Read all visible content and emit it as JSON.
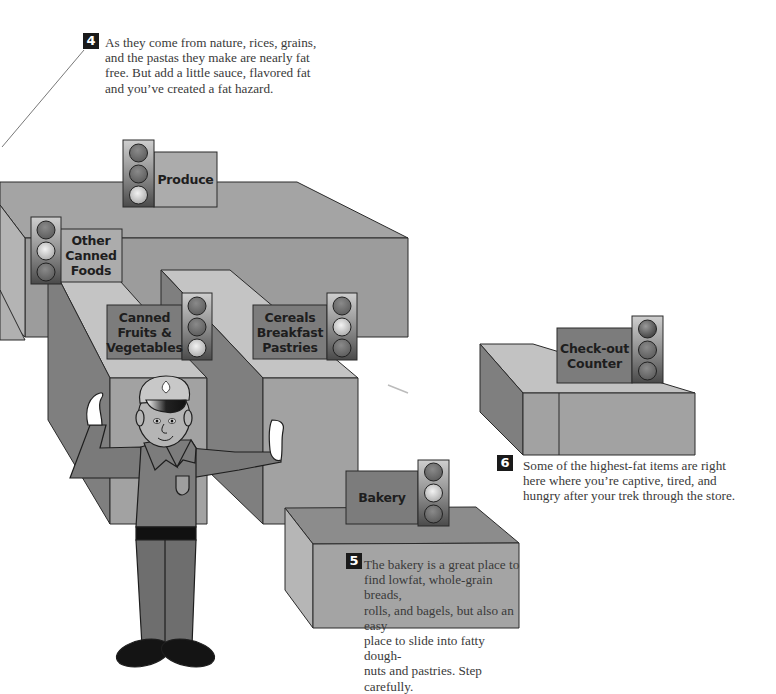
{
  "colors": {
    "background": "#ffffff",
    "box_top": "#a6a6a6",
    "box_front": "#9a9a9a",
    "box_side_dark": "#7d7d7d",
    "aisle_top_light": "#c6c6c6",
    "sign_light": "#a9a9a9",
    "sign_dark": "#7a7a7a",
    "light_housing": "#8c8c8c",
    "light_off": "#6e6e6e",
    "light_on": "#d8d8d8",
    "officer_uniform": "#7a7a7a",
    "officer_skin": "#b3b3b3",
    "outline": "#2a2a2a"
  },
  "callouts": [
    {
      "number": "4",
      "lines": [
        "As they come from nature, rices, grains,",
        "and the pastas they make are nearly fat",
        "free. But add a little sauce, flavored fat",
        "and you’ve created a fat hazard."
      ]
    },
    {
      "number": "5",
      "lines": [
        "The bakery is a great place to",
        "find lowfat, whole-grain breads,",
        "rolls, and bagels, but also an easy",
        "place to slide into fatty dough-",
        "nuts and pastries. Step carefully."
      ]
    },
    {
      "number": "6",
      "lines": [
        "Some of the highest-fat items are right",
        "here where you’re captive, tired, and",
        "hungry after your trek through the store."
      ]
    }
  ],
  "signs": [
    {
      "id": "produce",
      "label": "Produce",
      "lit": "bottom",
      "light_meaning": "green"
    },
    {
      "id": "other-canned-foods",
      "label": "Other\nCanned\nFoods",
      "lit": "middle",
      "light_meaning": "yellow"
    },
    {
      "id": "canned-fruits-vegetables",
      "label": "Canned\nFruits &\nVegetables",
      "lit": "bottom",
      "light_meaning": "green"
    },
    {
      "id": "cereals-breakfast-pastries",
      "label": "Cereals\nBreakfast\nPastries",
      "lit": "middle",
      "light_meaning": "yellow"
    },
    {
      "id": "bakery",
      "label": "Bakery",
      "lit": "middle",
      "light_meaning": "yellow"
    },
    {
      "id": "check-out-counter",
      "label": "Check-out\nCounter",
      "lit": "top",
      "light_meaning": "red"
    }
  ],
  "figure": {
    "character": "traffic police officer",
    "pose": "both hands raised in stop gesture"
  }
}
